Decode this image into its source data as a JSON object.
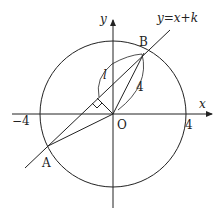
{
  "diagram": {
    "axis_labels": {
      "x": "x",
      "y": "y"
    },
    "line_label": "y=x+k",
    "points": {
      "A": "A",
      "B": "B",
      "O": "O"
    },
    "ticks": {
      "neg4": "−4",
      "pos4": "4"
    },
    "segment_labels": {
      "l": "l",
      "radius": "4"
    },
    "circle": {
      "center": "O",
      "radius": 4
    },
    "colors": {
      "stroke": "#222222",
      "background": "#ffffff"
    }
  }
}
